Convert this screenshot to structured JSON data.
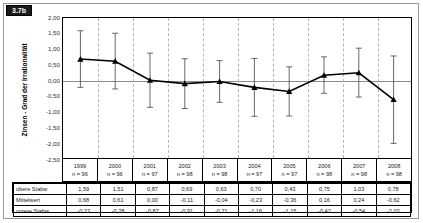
{
  "figure": {
    "badge": "3.7b",
    "y_axis_title": "Zinsen - Grad der Irrationalität"
  },
  "chart_data": {
    "type": "line",
    "title": "",
    "xlabel": "",
    "ylabel": "Zinsen - Grad der Irrationalität",
    "ylim": [
      -2.5,
      2.0
    ],
    "ytick_labels": [
      "2,00",
      "1,50",
      "1,00",
      "0,50",
      "0,00",
      "-0,50",
      "-1,00",
      "-1,50",
      "-2,00",
      "-2,50"
    ],
    "ytick_values": [
      2.0,
      1.5,
      1.0,
      0.5,
      0.0,
      -0.5,
      -1.0,
      -1.5,
      -2.0,
      -2.5
    ],
    "grid": "vertical-dashed",
    "legend": "none",
    "categories": [
      "1999",
      "2000",
      "2001",
      "2002",
      "2003",
      "2004",
      "2005",
      "2006",
      "2007",
      "2008"
    ],
    "sample_sizes": [
      "n = 96",
      "n = 96",
      "n = 97",
      "n = 98",
      "n = 98",
      "n = 97",
      "n = 97",
      "n = 98",
      "n = 98",
      "n = 98"
    ],
    "series": [
      {
        "name": "obere Stabw",
        "values": [
          1.59,
          1.51,
          0.87,
          0.69,
          0.63,
          0.7,
          0.43,
          0.75,
          1.03,
          0.78
        ]
      },
      {
        "name": "Mittelwert",
        "values": [
          0.68,
          0.61,
          0.0,
          -0.11,
          -0.04,
          -0.23,
          -0.36,
          0.16,
          0.24,
          -0.62
        ]
      },
      {
        "name": "untere Stabw",
        "values": [
          -0.23,
          -0.28,
          -0.87,
          -0.91,
          -0.71,
          -1.16,
          -1.15,
          -0.42,
          -0.54,
          -2.03
        ]
      }
    ]
  },
  "table": {
    "row_labels": [
      "obere Stabw",
      "Mittelwert",
      "untere Stabw"
    ],
    "rows": [
      [
        "1,59",
        "1,51",
        "0,87",
        "0,69",
        "0,63",
        "0,70",
        "0,43",
        "0,75",
        "1,03",
        "0,78"
      ],
      [
        "0,68",
        "0,61",
        "0,00",
        "-0,11",
        "-0,04",
        "-0,23",
        "-0,36",
        "0,16",
        "0,24",
        "-0,62"
      ],
      [
        "-0,23",
        "-0,28",
        "-0,87",
        "-0,91",
        "-0,71",
        "-1,16",
        "-1,15",
        "-0,42",
        "-0,54",
        "-2,03"
      ]
    ]
  },
  "colors": {
    "marker": "#000000",
    "line": "#000000",
    "errorbar": "#555555",
    "grid": "#b6b6b6",
    "zero_line": "#8d8d8d",
    "badge_bg": "#1b1b1b"
  }
}
